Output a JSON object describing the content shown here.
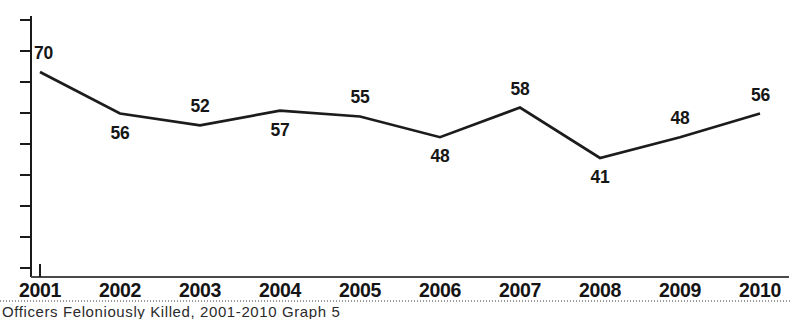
{
  "chart_data": {
    "type": "line",
    "title": "",
    "subtitle": "",
    "xlabel": "",
    "ylabel": "",
    "categories": [
      "2001",
      "2002",
      "2003",
      "2004",
      "2005",
      "2006",
      "2007",
      "2008",
      "2009",
      "2010"
    ],
    "values": [
      70,
      56,
      52,
      57,
      55,
      48,
      58,
      41,
      48,
      56
    ],
    "series": [
      {
        "name": "Officers Feloniously Killed",
        "values": [
          70,
          56,
          52,
          57,
          55,
          48,
          58,
          41,
          48,
          56
        ]
      }
    ],
    "data_labels": [
      "70",
      "56",
      "52",
      "57",
      "55",
      "48",
      "58",
      "41",
      "48",
      "56"
    ],
    "data_label_positions": [
      "above",
      "below",
      "above",
      "below",
      "above",
      "below",
      "above",
      "below",
      "above",
      "above"
    ],
    "ylim": [
      0,
      80
    ],
    "y_tick_count": 9,
    "y_tick_labels_shown": false,
    "grid": false,
    "legend": false,
    "legend_position": "none",
    "line_color": "#1c1c1c",
    "axis_color": "#1a1a1a",
    "background_color": "#ffffff"
  },
  "axes": {
    "y_axis_name": "y-axis",
    "x_axis_name": "x-axis",
    "tick_labels": [
      "2001",
      "2002",
      "2003",
      "2004",
      "2005",
      "2006",
      "2007",
      "2008",
      "2009",
      "2010"
    ]
  },
  "caption": {
    "text": "Officers Feloniously Killed, 2001-2010 Graph 5"
  }
}
